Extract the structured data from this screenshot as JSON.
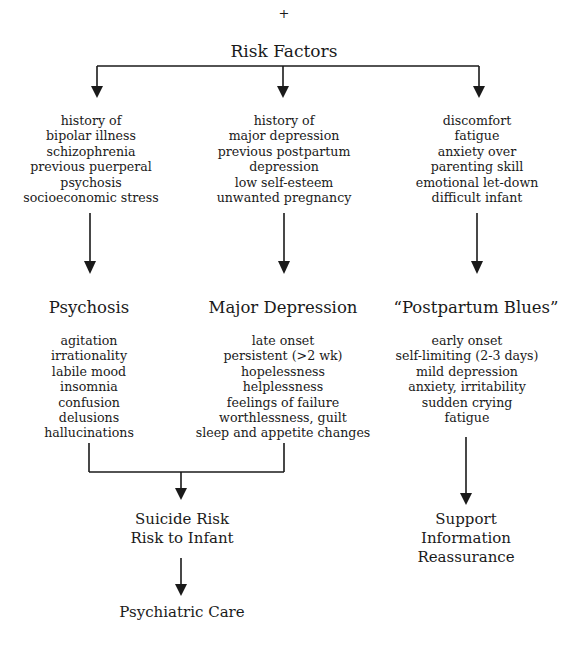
{
  "top_marker": "+",
  "root": {
    "label": "Risk Factors"
  },
  "columns": [
    {
      "risk_factors": [
        "history of",
        "bipolar illness",
        "schizophrenia",
        "previous puerperal",
        "psychosis",
        "socioeconomic stress"
      ],
      "condition": "Psychosis",
      "symptoms": [
        "agitation",
        "irrationality",
        "labile mood",
        "insomnia",
        "confusion",
        "delusions",
        "hallucinations"
      ]
    },
    {
      "risk_factors": [
        "history of",
        "major depression",
        "previous postpartum",
        "depression",
        "low self-esteem",
        "unwanted pregnancy"
      ],
      "condition": "Major Depression",
      "symptoms": [
        "late onset",
        "persistent (>2 wk)",
        "hopelessness",
        "helplessness",
        "feelings of failure",
        "worthlessness, guilt",
        "sleep and appetite changes"
      ]
    },
    {
      "risk_factors": [
        "discomfort",
        "fatigue",
        "anxiety over",
        "parenting skill",
        "emotional let-down",
        "difficult infant"
      ],
      "condition": "“Postpartum Blues”",
      "symptoms": [
        "early onset",
        "self-limiting (2-3 days)",
        "mild depression",
        "anxiety, irritability",
        "sudden crying",
        "fatigue"
      ]
    }
  ],
  "outcomes": {
    "combined_risk": [
      "Suicide Risk",
      "Risk to Infant"
    ],
    "combined_care": "Psychiatric Care",
    "blues_management": [
      "Support",
      "Information",
      "Reassurance"
    ]
  },
  "colors": {
    "line": "#1a1a1a",
    "text": "#1a1a1a",
    "background": "#ffffff"
  }
}
